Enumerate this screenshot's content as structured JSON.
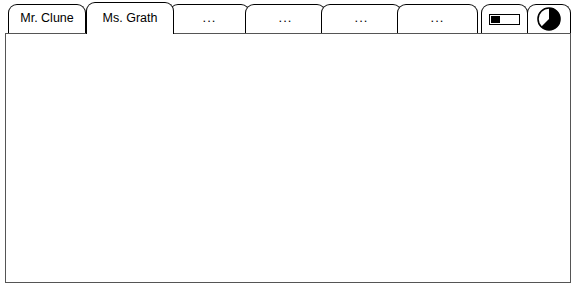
{
  "window": {
    "title": "Graph Club"
  },
  "tabs": [
    {
      "id": "mr-clune",
      "label": "Mr. Clune",
      "type": "text",
      "active": false,
      "x": 8,
      "width": 78
    },
    {
      "id": "ms-grath",
      "label": "Ms. Grath",
      "type": "text",
      "active": true,
      "x": 86,
      "width": 88
    },
    {
      "id": "tab-3",
      "label": "...",
      "type": "text",
      "active": false,
      "x": 169,
      "width": 81
    },
    {
      "id": "tab-4",
      "label": "...",
      "type": "text",
      "active": false,
      "x": 245,
      "width": 81
    },
    {
      "id": "tab-5",
      "label": "...",
      "type": "text",
      "active": false,
      "x": 321,
      "width": 81
    },
    {
      "id": "tab-6",
      "label": "...",
      "type": "text",
      "active": false,
      "x": 397,
      "width": 81
    },
    {
      "id": "bar-view",
      "label": "",
      "type": "bar-chart-icon",
      "icon": "bar-chart-icon",
      "active": false,
      "x": 481,
      "width": 47
    },
    {
      "id": "pie-view",
      "label": "",
      "type": "pie-chart-icon",
      "icon": "pie-chart-icon",
      "active": false,
      "x": 527,
      "width": 44
    }
  ],
  "chart_data": {
    "type": "bar",
    "title": "",
    "xlabel": "",
    "ylabel": "",
    "categories": [
      "Chicken",
      "Pizza",
      "Tacos",
      "Hamburger"
    ],
    "values": [
      4,
      12,
      6,
      2
    ],
    "total": 24,
    "total_label": "24",
    "colors": [
      "#666666",
      "#d9d9d9",
      "#666666",
      "#d9d9d9"
    ],
    "axis": {
      "min": 0,
      "max": 50,
      "ticks": [
        0,
        10,
        20,
        30,
        40,
        50
      ],
      "tick_labels": [
        "0",
        "10",
        "20",
        "30",
        "40",
        "50"
      ],
      "grid": false,
      "orientation": "horizontal",
      "px_start": 34,
      "px_end": 530
    },
    "stacked_bar": {
      "segments": [
        {
          "label": "Chicken",
          "value": 4,
          "color": "#666666",
          "start": 0,
          "end": 4
        },
        {
          "label": "Pizza",
          "value": 12,
          "color": "#d9d9d9",
          "start": 4,
          "end": 16
        },
        {
          "label": "Tacos",
          "value": 6,
          "color": "#666666",
          "start": 16,
          "end": 22
        },
        {
          "label": "Hamburger",
          "value": 2,
          "color": "#d9d9d9",
          "start": 22,
          "end": 24
        }
      ]
    },
    "pie": {
      "type": "pie",
      "slices": [
        {
          "label": "Chicken",
          "value": 4,
          "color": "#666666",
          "angle_deg": 60
        },
        {
          "label": "Pizza",
          "value": 12,
          "color": "#d9d9d9",
          "angle_deg": 180
        },
        {
          "label": "Tacos",
          "value": 6,
          "color": "#666666",
          "angle_deg": 90
        },
        {
          "label": "Hamburger",
          "value": 2,
          "color": "#d9d9d9",
          "angle_deg": 30
        }
      ],
      "start_angle_deg": 0,
      "total": 24
    },
    "legend": {
      "position": "left",
      "rows": [
        {
          "label": "Chicken",
          "value": "4",
          "color": "#666666"
        },
        {
          "label": "Pizza",
          "value": "12",
          "color": "#d9d9d9"
        },
        {
          "label": "Tacos",
          "value": "6",
          "color": "#666666"
        },
        {
          "label": "Hamburger",
          "value": "2",
          "color": "#d9d9d9"
        }
      ]
    }
  }
}
